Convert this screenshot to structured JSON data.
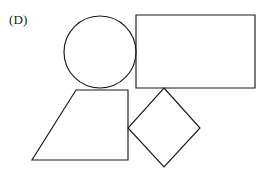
{
  "figure": {
    "panel_label": "(D)",
    "background_color": "#ffffff",
    "stroke_color": "#1a1a1a",
    "stroke_width": 1.15,
    "width": 266,
    "height": 191
  },
  "chart_data": {
    "type": "diagram",
    "title": "(D)",
    "subtitle": "",
    "axis": {
      "grid": false,
      "legend": false,
      "xlim": [
        0,
        266
      ],
      "ylim": [
        0,
        191
      ]
    },
    "shapes": [
      {
        "name": "circle",
        "kind": "circle",
        "cx": 100,
        "cy": 52,
        "r": 36,
        "fill": "none",
        "stroke": "#1a1a1a"
      },
      {
        "name": "rectangle",
        "kind": "rect",
        "x": 136,
        "y": 15,
        "width": 119,
        "height": 73,
        "fill": "none",
        "stroke": "#1a1a1a"
      },
      {
        "name": "trapezoid",
        "kind": "polygon",
        "points": "76,90 128,90 128,160 32,160",
        "fill": "none",
        "stroke": "#1a1a1a"
      },
      {
        "name": "diamond",
        "kind": "polygon",
        "points": "164,88 200,128 164,167 128,128",
        "fill": "none",
        "stroke": "#1a1a1a"
      }
    ]
  }
}
